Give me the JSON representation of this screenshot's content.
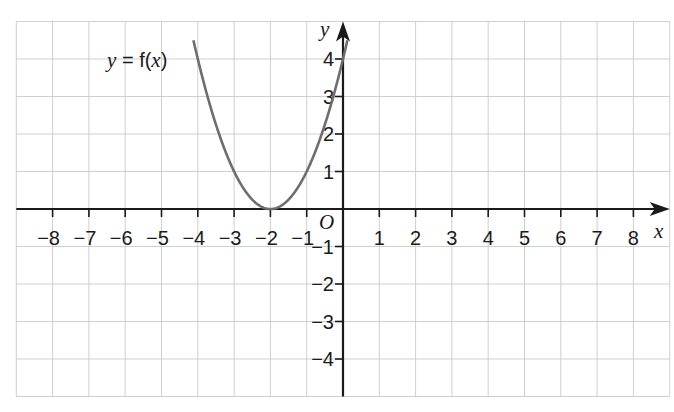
{
  "chart_data": {
    "type": "line",
    "title": "",
    "function_label": {
      "prefix": "y",
      "equals": " = ",
      "fname": "f(",
      "var": "x",
      "close": ")"
    },
    "xlabel": "x",
    "ylabel": "y",
    "origin_label": "O",
    "xlim": [
      -9,
      9
    ],
    "ylim": [
      -5,
      5
    ],
    "grid": true,
    "x_ticks": [
      -8,
      -7,
      -6,
      -5,
      -4,
      -3,
      -2,
      -1,
      1,
      2,
      3,
      4,
      5,
      6,
      7,
      8
    ],
    "y_ticks": [
      -4,
      -3,
      -2,
      -1,
      1,
      2,
      3,
      4
    ],
    "series": [
      {
        "name": "y = f(x)",
        "expression": "(x+2)^2",
        "vertex": [
          -2,
          0
        ],
        "x": [
          -4.2,
          -4,
          -3.5,
          -3,
          -2.5,
          -2,
          -1.5,
          -1,
          -0.5,
          0,
          0.2
        ],
        "y": [
          4.84,
          4,
          2.25,
          1,
          0.25,
          0,
          0.25,
          1,
          2.25,
          4,
          4.84
        ]
      }
    ]
  },
  "colors": {
    "grid": "#cfcfcf",
    "axis": "#1a1a1a",
    "curve": "#6e6e6e",
    "background": "#ffffff"
  }
}
